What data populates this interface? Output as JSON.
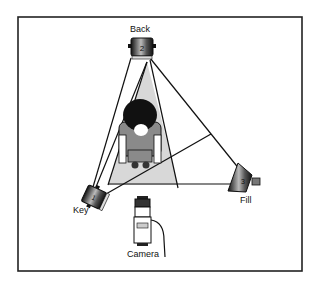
{
  "diagram": {
    "lights": [
      {
        "name": "Key",
        "number": "1",
        "label": "Key"
      },
      {
        "name": "Back",
        "number": "2",
        "label": "Back"
      },
      {
        "name": "Fill",
        "number": "3",
        "label": "Fill"
      }
    ],
    "camera": {
      "label": "Camera"
    },
    "subject": {
      "label": "Subject (top view)"
    },
    "colors": {
      "frame": "#222222",
      "beam": "#d6d6d6",
      "line": "#111111",
      "shirt": "#8a8a8a",
      "hair": "#111111"
    }
  }
}
